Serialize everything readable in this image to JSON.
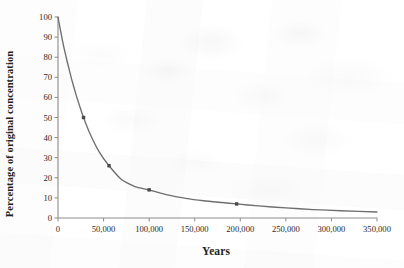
{
  "figure": {
    "y_axis_title": "Percentage of original concentration",
    "x_axis_title": "Years",
    "line_color": "#6f6f72",
    "marker_color": "#4a4a4e",
    "axis_color": "#8d8d90",
    "background_color": "#ffffff"
  },
  "chart_data": {
    "type": "line",
    "title": "",
    "subtitle": "",
    "xlabel": "Years",
    "ylabel": "Percentage of original concentration",
    "xlim": [
      0,
      350000
    ],
    "ylim": [
      0,
      100
    ],
    "grid": false,
    "legend": false,
    "legend_position": "none",
    "x_ticks": [
      0,
      50000,
      100000,
      150000,
      200000,
      250000,
      300000,
      350000
    ],
    "x_tick_labels": [
      "0",
      "50,000",
      "100,000",
      "150,000",
      "200,000",
      "250,000",
      "300,000",
      "350,000"
    ],
    "y_ticks": [
      0,
      10,
      20,
      30,
      40,
      50,
      60,
      70,
      80,
      90,
      100
    ],
    "y_tick_labels": [
      "0",
      "10",
      "20",
      "30",
      "40",
      "50",
      "60",
      "70",
      "80",
      "90",
      "100"
    ],
    "series": [
      {
        "name": "Percentage of original concentration",
        "x": [
          0,
          5000,
          10000,
          15000,
          20000,
          25000,
          28000,
          35000,
          45000,
          56000,
          70000,
          85000,
          100000,
          120000,
          140000,
          160000,
          180000,
          196000,
          220000,
          250000,
          280000,
          310000,
          350000
        ],
        "values": [
          100,
          88,
          78,
          69,
          61,
          54,
          50,
          42,
          33,
          26,
          19,
          15.5,
          14,
          11.5,
          9.8,
          8.6,
          7.7,
          7,
          6,
          5,
          4.2,
          3.6,
          3
        ]
      }
    ],
    "markers": [
      {
        "x": 28000,
        "y": 50,
        "label": "50% at ~28,000 years"
      },
      {
        "x": 56000,
        "y": 26,
        "label": "26% at ~56,000 years"
      },
      {
        "x": 100000,
        "y": 14,
        "label": "14% at 100,000 years"
      },
      {
        "x": 196000,
        "y": 7,
        "label": "7% at ~196,000 years"
      }
    ],
    "annotations": []
  }
}
